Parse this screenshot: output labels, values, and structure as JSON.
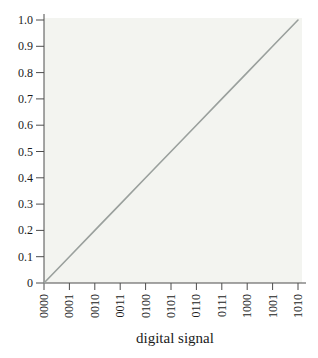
{
  "chart_data": {
    "type": "line",
    "title": "",
    "xlabel": "digital signal",
    "ylabel": "",
    "categories": [
      "0000",
      "0001",
      "0010",
      "0011",
      "0100",
      "0101",
      "0110",
      "0111",
      "1000",
      "1001",
      "1010"
    ],
    "values": [
      0,
      0.1,
      0.2,
      0.3,
      0.4,
      0.5,
      0.6,
      0.7,
      0.8,
      0.9,
      1.0
    ],
    "ytick_labels": [
      "0",
      "0.1",
      "0.2",
      "0.3",
      "0.4",
      "0.5",
      "0.6",
      "0.7",
      "0.8",
      "0.9",
      "1.0"
    ],
    "ylim": [
      0,
      1.0
    ],
    "xtick_rotation_deg": 90,
    "grid": false,
    "legend": "none",
    "colors": {
      "line": "#9aa09d",
      "plot_background": "#f3f4f0",
      "axis": "#4d4d4d",
      "text": "#1b1b1b"
    }
  }
}
